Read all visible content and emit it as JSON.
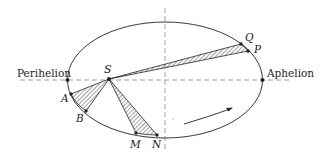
{
  "diagram": {
    "type": "kepler-second-law-orbit",
    "labels": {
      "perihelion": "Perihelion",
      "aphelion": "Aphelion",
      "sun": "S",
      "points": {
        "A": "A",
        "B": "B",
        "M": "M",
        "N": "N",
        "P": "P",
        "Q": "Q"
      }
    },
    "colors": {
      "stroke": "#222222",
      "dashed": "#888888",
      "background": "#ffffff"
    }
  }
}
